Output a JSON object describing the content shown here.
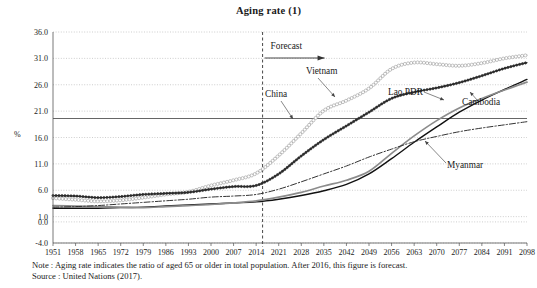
{
  "chart_data": {
    "type": "line",
    "title": "Aging rate (1)",
    "xlabel": "",
    "ylabel": "%",
    "ylim": [
      -4.0,
      36.0
    ],
    "xlim": [
      1951,
      2098
    ],
    "grid": true,
    "legend_position": "inline-annotations",
    "y_ticks": [
      "36.0",
      "31.0",
      "26.0",
      "21.0",
      "16.0",
      "11.0",
      "6.0",
      "1.0",
      "0.0",
      "-4.0"
    ],
    "y_tick_values": [
      36.0,
      31.0,
      26.0,
      21.0,
      16.0,
      11.0,
      6.0,
      1.0,
      0.0,
      -4.0
    ],
    "x_ticks": [
      "1951",
      "1958",
      "1965",
      "1972",
      "1979",
      "1986",
      "1993",
      "2000",
      "2007",
      "2014",
      "2021",
      "2028",
      "2035",
      "2042",
      "2049",
      "2056",
      "2063",
      "2070",
      "2077",
      "2084",
      "2091",
      "2098"
    ],
    "x_tick_values": [
      1951,
      1958,
      1965,
      1972,
      1979,
      1986,
      1993,
      2000,
      2007,
      2014,
      2021,
      2028,
      2035,
      2042,
      2049,
      2056,
      2063,
      2070,
      2077,
      2084,
      2091,
      2098
    ],
    "annotations": [
      {
        "name": "forecast",
        "text": "Forecast",
        "year": 2016,
        "type": "vertical-dashed-line-with-arrow"
      }
    ],
    "reference_line": {
      "name": "aged-society-threshold",
      "value": 19.6,
      "style": "solid"
    },
    "x": [
      1951,
      1958,
      1965,
      1972,
      1979,
      1986,
      1993,
      2000,
      2007,
      2014,
      2021,
      2028,
      2035,
      2042,
      2049,
      2056,
      2063,
      2070,
      2077,
      2084,
      2091,
      2098
    ],
    "series": [
      {
        "name": "China",
        "label": "China",
        "style": "circle-marker-light",
        "color": "#9a9a9a",
        "values": [
          4.5,
          4.2,
          3.9,
          4.1,
          4.6,
          5.2,
          5.7,
          6.9,
          7.9,
          9.2,
          12.6,
          16.8,
          21.1,
          23.0,
          25.3,
          29.0,
          30.2,
          29.9,
          29.6,
          30.1,
          31.0,
          31.6
        ]
      },
      {
        "name": "Vietnam",
        "label": "Vietnam",
        "style": "dot-marker-dark",
        "color": "#2b2b2b",
        "values": [
          5.0,
          4.9,
          4.6,
          4.8,
          5.2,
          5.4,
          5.6,
          6.2,
          6.7,
          6.9,
          9.1,
          12.5,
          15.6,
          18.2,
          20.8,
          23.4,
          24.6,
          25.4,
          26.4,
          27.7,
          29.1,
          30.2
        ]
      },
      {
        "name": "Lao PDR",
        "label": "Lao PDR",
        "style": "solid-black",
        "color": "#111111",
        "values": [
          2.6,
          2.6,
          2.6,
          2.7,
          2.8,
          3.0,
          3.2,
          3.4,
          3.6,
          3.8,
          4.3,
          5.0,
          5.9,
          7.1,
          9.1,
          12.0,
          15.1,
          18.0,
          20.8,
          23.1,
          25.1,
          27.0
        ]
      },
      {
        "name": "Cambodia",
        "label": "Cambodia",
        "style": "solid-gray",
        "color": "#8c8c8c",
        "values": [
          3.1,
          3.0,
          2.9,
          2.8,
          2.7,
          2.9,
          3.1,
          3.3,
          3.6,
          4.0,
          4.7,
          5.6,
          6.8,
          7.9,
          9.6,
          13.0,
          16.3,
          19.2,
          21.6,
          23.4,
          25.0,
          26.5
        ]
      },
      {
        "name": "Myanmar",
        "label": "Myanmar",
        "style": "dash-dot",
        "color": "#333333",
        "values": [
          2.8,
          2.9,
          3.1,
          3.4,
          3.7,
          4.0,
          4.3,
          4.7,
          4.9,
          5.2,
          6.2,
          7.6,
          9.1,
          10.6,
          12.3,
          13.8,
          15.2,
          16.2,
          17.1,
          17.8,
          18.4,
          19.0
        ]
      }
    ]
  },
  "notes": {
    "line1": "Note : Aging rate indicates the ratio of aged 65 or older in total population. After 2016, this figure is forecast.",
    "line2": "Source : United Nations (2017)."
  },
  "labels": {
    "y_axis_unit": "%"
  }
}
